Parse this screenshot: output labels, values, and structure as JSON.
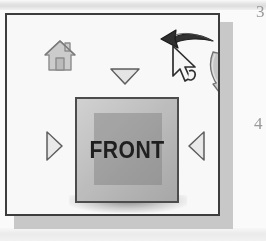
{
  "figure": {
    "name": "view-cube-navigation-widget",
    "caption_text": ""
  },
  "panel": {
    "background_color": "#fdfdfd",
    "border_color": "#3a3a3a",
    "shadow_color": "#b9b9b9"
  },
  "cube": {
    "label": "FRONT",
    "label_color": "#1b1b1b",
    "face_color": "#c3c3c3",
    "inner_face_color": "#7c7c7c",
    "border_color": "#4a4a4a"
  },
  "controls": {
    "home_icon_label": "home-icon",
    "triangle_top_label": "rotate-down-arrow",
    "triangle_bottom_label": "rotate-up-arrow",
    "triangle_left_label": "rotate-right-arrow",
    "triangle_right_label": "rotate-left-arrow",
    "roll_left_arrow_label": "roll-counterclockwise-arrow",
    "roll_right_arrow_label": "roll-clockwise-arrow",
    "cursor_label": "mouse-pointer"
  },
  "colors": {
    "arrow_dark": "#2e2e2e",
    "arrow_light": "#c8c8c8",
    "triangle_fill": "#e3e3e3",
    "triangle_stroke": "#6e6e6e"
  },
  "margin_notes": {
    "top_number": "3",
    "mid_number": "4"
  }
}
